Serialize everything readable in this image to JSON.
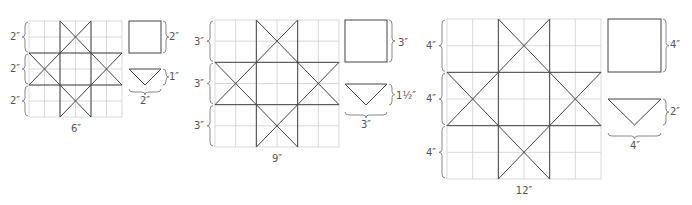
{
  "colors": {
    "grid": "#cfcfcf",
    "lines": "#444444",
    "text": "#555555"
  },
  "blocks": [
    {
      "name": "6-inch-block",
      "size_label": "6″",
      "row_labels": [
        "2″",
        "2″",
        "2″"
      ],
      "square_label": "2″",
      "triangle_height_label": "1″",
      "triangle_width_label": "2″"
    },
    {
      "name": "9-inch-block",
      "size_label": "9″",
      "row_labels": [
        "3″",
        "3″",
        "3″"
      ],
      "square_label": "3″",
      "triangle_height_label": "1½″",
      "triangle_width_label": "3″"
    },
    {
      "name": "12-inch-block",
      "size_label": "12″",
      "row_labels": [
        "4″",
        "4″",
        "4″"
      ],
      "square_label": "4″",
      "triangle_height_label": "2″",
      "triangle_width_label": "4″"
    }
  ]
}
